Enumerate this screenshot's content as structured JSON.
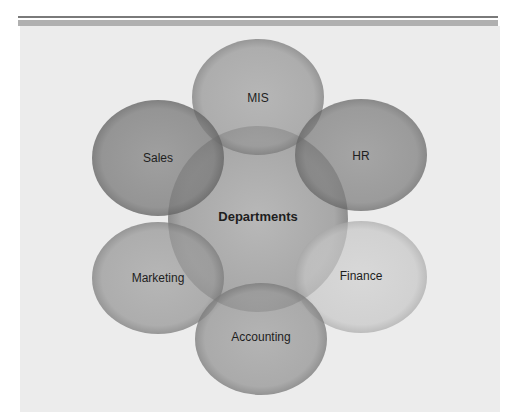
{
  "diagram": {
    "type": "overlapping-circles",
    "center": {
      "label": "Departments"
    },
    "nodes": [
      {
        "label": "MIS",
        "position": "top"
      },
      {
        "label": "HR",
        "position": "upper-right"
      },
      {
        "label": "Finance",
        "position": "lower-right"
      },
      {
        "label": "Accounting",
        "position": "bottom"
      },
      {
        "label": "Marketing",
        "position": "lower-left"
      },
      {
        "label": "Sales",
        "position": "upper-left"
      }
    ]
  },
  "colors": {
    "panel": "#ececec",
    "rule_dark": "#7a7a7a",
    "rule_light": "#b0b0b0",
    "circle_dark": "#6e6e6e",
    "circle_mid": "#8c8c8c",
    "circle_light": "#b4b4b4",
    "center": "#a6a6a6"
  }
}
